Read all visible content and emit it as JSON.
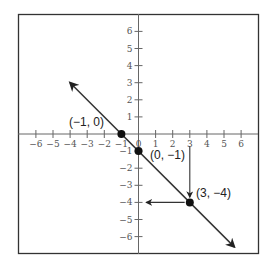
{
  "chart_data": {
    "type": "line",
    "title": "",
    "xlabel": "",
    "ylabel": "",
    "xlim": [
      -7,
      7
    ],
    "ylim": [
      -7,
      7
    ],
    "grid": false,
    "x_ticks": [
      -6,
      -5,
      -4,
      -3,
      -2,
      -1,
      0,
      1,
      2,
      3,
      4,
      5,
      6
    ],
    "y_ticks": [
      -6,
      -5,
      -4,
      -3,
      -2,
      -1,
      0,
      1,
      2,
      3,
      4,
      5,
      6
    ],
    "x_tick_labels": [
      "−6",
      "−5",
      "−4",
      "−3",
      "−2",
      "−1",
      "0",
      "1",
      "2",
      "3",
      "4",
      "5",
      "6"
    ],
    "y_tick_labels": [
      "−6",
      "−5",
      "−4",
      "−3",
      "−2",
      "−1",
      "0",
      "1",
      "2",
      "3",
      "4",
      "5",
      "6"
    ],
    "series": [
      {
        "name": "y = -x - 1",
        "equation": "y = -x - 1",
        "slope": -1,
        "intercept": -1,
        "x": [
          -4,
          5.6
        ],
        "y": [
          3,
          -6.6
        ],
        "arrows_both_ends": true
      }
    ],
    "points": [
      {
        "x": -1,
        "y": 0,
        "label": "(−1, 0)"
      },
      {
        "x": 0,
        "y": -1,
        "label": "(0, −1)"
      },
      {
        "x": 3,
        "y": -4,
        "label": "(3, −4)"
      }
    ],
    "annotations": [
      {
        "type": "arrow",
        "from": [
          3,
          -0.7
        ],
        "to": [
          3,
          -3.7
        ],
        "description": "vertical arrow from x-axis at x=3 down to point (3,-4)"
      },
      {
        "type": "arrow",
        "from": [
          2.7,
          -4
        ],
        "to": [
          0.45,
          -4
        ],
        "description": "horizontal arrow from point (3,-4) left to y-axis at y=-4"
      }
    ]
  },
  "labels": {
    "p1": "(−1, 0)",
    "p2": "(0, −1)",
    "p3": "(3, −4)"
  }
}
